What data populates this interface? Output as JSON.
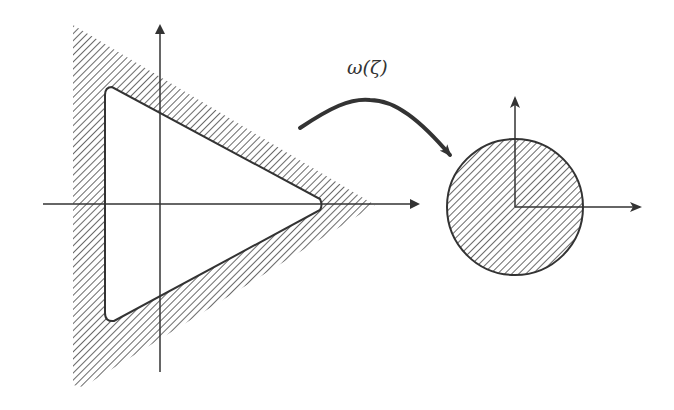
{
  "diagram": {
    "type": "conformal-mapping",
    "mapping_label": "ω(ζ)",
    "colors": {
      "stroke": "#333333",
      "hatch": "#444444",
      "background": "#ffffff"
    },
    "left_figure": {
      "description": "Hatched triangular region with triangular hole (rounded corners) in the ζ-plane",
      "axes": [
        "horizontal",
        "vertical"
      ]
    },
    "right_figure": {
      "description": "Hatched unit disk with axes in the ω-plane",
      "axes": [
        "horizontal",
        "vertical"
      ]
    }
  }
}
